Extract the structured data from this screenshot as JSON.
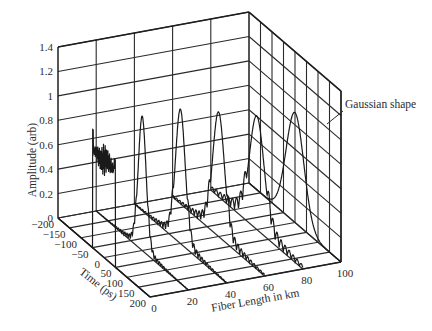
{
  "chart_data": {
    "type": "line",
    "projection": "3d-waterfall",
    "title": "",
    "xlabel": "Fiber Length in km",
    "ylabel": "Time (ps)",
    "zlabel": "Amplitude (arb)",
    "x_ticks": [
      0,
      20,
      40,
      60,
      80,
      100
    ],
    "y_ticks": [
      -200,
      -150,
      -100,
      -50,
      0,
      50,
      100,
      150,
      200
    ],
    "z_ticks": [
      0,
      0.2,
      0.4,
      0.6,
      0.8,
      1,
      1.2,
      1.4
    ],
    "xlim": [
      0,
      100
    ],
    "ylim": [
      -200,
      200
    ],
    "zlim": [
      0,
      1.4
    ],
    "grid": true,
    "annotation": {
      "text": "Gaussian shape",
      "target_series": "100 km"
    },
    "series": [
      {
        "name": "0 km",
        "fiber_km": 0,
        "shape": "square pulse with noisy top",
        "width_ps": 100,
        "peak": 0.97,
        "plateau": 0.8
      },
      {
        "name": "20 km",
        "fiber_km": 20,
        "shape": "main peak with ripples",
        "peak": 1.1,
        "fwhm_ps": 40
      },
      {
        "name": "40 km",
        "fiber_km": 40,
        "shape": "main peak with ripples",
        "peak": 1.1,
        "fwhm_ps": 50
      },
      {
        "name": "60 km",
        "fiber_km": 60,
        "shape": "main peak with ripples",
        "peak": 1.02,
        "fwhm_ps": 60
      },
      {
        "name": "80 km",
        "fiber_km": 80,
        "shape": "main peak with ripples",
        "peak": 0.93,
        "fwhm_ps": 75
      },
      {
        "name": "100 km",
        "fiber_km": 100,
        "shape": "gaussian",
        "peak": 0.9,
        "fwhm_ps": 90
      }
    ]
  },
  "labels": {
    "z_axis": "Amplitude (arb)",
    "y_axis": "Time (ps)",
    "x_axis": "Fiber Length in km",
    "annotation": "Gaussian shape",
    "z_ticks": [
      "0",
      "0.2",
      "0.4",
      "0.6",
      "0.8",
      "1",
      "1.2",
      "1.4"
    ],
    "y_ticks": [
      "−200",
      "−150",
      "−100",
      "−50",
      "0",
      "50",
      "100",
      "150",
      "200"
    ],
    "x_ticks": [
      "0",
      "20",
      "40",
      "60",
      "80",
      "100"
    ]
  }
}
